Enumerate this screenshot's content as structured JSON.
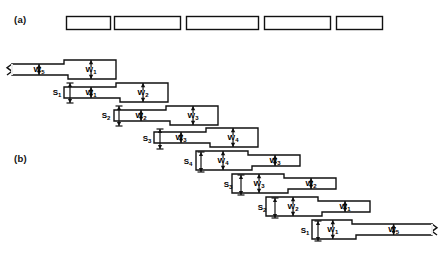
{
  "figure": {
    "name": "stepped-waveguide-taper-diagram",
    "background": "#ffffff",
    "stroke": "#111111",
    "width": 444,
    "height": 279
  },
  "panels": [
    {
      "key": "a",
      "label": "(a)",
      "x": 14,
      "y": 14
    },
    {
      "key": "b",
      "label": "(b)",
      "x": 14,
      "y": 153
    }
  ],
  "panel_a": {
    "name": "row-of-separate-sections",
    "bars": [
      {
        "x": 66,
        "y": 16,
        "w": 44,
        "h": 13
      },
      {
        "x": 114,
        "y": 16,
        "w": 66,
        "h": 13
      },
      {
        "x": 186,
        "y": 16,
        "w": 72,
        "h": 13
      },
      {
        "x": 264,
        "y": 16,
        "w": 66,
        "h": 13
      },
      {
        "x": 336,
        "y": 16,
        "w": 46,
        "h": 13
      }
    ]
  },
  "panel_b": {
    "name": "staircase-of-stepped-sections",
    "rows": [
      {
        "x": 12,
        "y": 60,
        "w": 104,
        "h": 19,
        "split": 52,
        "left_label": "W",
        "left_sub": "5",
        "right_label": "W",
        "right_sub": "1",
        "jag": "left",
        "step": "up"
      },
      {
        "x": 64,
        "y": 83,
        "w": 104,
        "h": 19,
        "split": 52,
        "left_label": "W",
        "left_sub": "1",
        "right_label": "W",
        "right_sub": "2",
        "jag": "none",
        "step": "up"
      },
      {
        "x": 114,
        "y": 106,
        "w": 104,
        "h": 19,
        "split": 52,
        "left_label": "W",
        "left_sub": "2",
        "right_label": "W",
        "right_sub": "3",
        "jag": "none",
        "step": "up"
      },
      {
        "x": 154,
        "y": 128,
        "w": 104,
        "h": 19,
        "split": 52,
        "left_label": "W",
        "left_sub": "3",
        "right_label": "W",
        "right_sub": "4",
        "jag": "none",
        "step": "up"
      },
      {
        "x": 196,
        "y": 151,
        "w": 104,
        "h": 19,
        "split": 52,
        "left_label": "W",
        "left_sub": "4",
        "right_label": "W",
        "right_sub": "3",
        "jag": "none",
        "step": "down"
      },
      {
        "x": 232,
        "y": 174,
        "w": 104,
        "h": 19,
        "split": 52,
        "left_label": "W",
        "left_sub": "3",
        "right_label": "W",
        "right_sub": "2",
        "jag": "none",
        "step": "down"
      },
      {
        "x": 266,
        "y": 197,
        "w": 104,
        "h": 19,
        "split": 52,
        "left_label": "W",
        "left_sub": "2",
        "right_label": "W",
        "right_sub": "1",
        "jag": "none",
        "step": "down"
      },
      {
        "x": 312,
        "y": 220,
        "w": 120,
        "h": 19,
        "split": 40,
        "left_label": "W",
        "left_sub": "1",
        "right_label": "W",
        "right_sub": "5",
        "jag": "right",
        "step": "down"
      }
    ],
    "offsets": [
      {
        "label": "S",
        "sub": "1",
        "x": 57,
        "y": 93
      },
      {
        "label": "S",
        "sub": "2",
        "x": 106,
        "y": 116
      },
      {
        "label": "S",
        "sub": "3",
        "x": 147,
        "y": 139
      },
      {
        "label": "S",
        "sub": "4",
        "x": 188,
        "y": 162
      },
      {
        "label": "S",
        "sub": "3",
        "x": 228,
        "y": 185
      },
      {
        "label": "S",
        "sub": "2",
        "x": 262,
        "y": 208
      },
      {
        "label": "S",
        "sub": "1",
        "x": 305,
        "y": 231
      }
    ]
  }
}
